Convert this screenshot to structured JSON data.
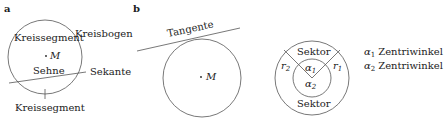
{
  "panels": {
    "a": {
      "label": "a",
      "segment_top": "Kreissegment",
      "arc": "Kreisbogen",
      "center": "M",
      "chord": "Sehne",
      "secant": "Sekante",
      "segment_bottom": "Kreissegment"
    },
    "b": {
      "label": "b",
      "tangent": "Tangente",
      "center": "M"
    },
    "c": {
      "sector_top": "Sektor",
      "sector_bottom": "Sektor",
      "r1": "r",
      "r1_sub": "1",
      "r2": "r",
      "r2_sub": "2",
      "alpha1": "α",
      "alpha1_sub": "1",
      "alpha2": "α",
      "alpha2_sub": "2"
    },
    "legend": [
      {
        "symbol": "α",
        "sub": "1",
        "text": "Zentriwinkel"
      },
      {
        "symbol": "α",
        "sub": "2",
        "text": "Zentriwinkel"
      }
    ]
  },
  "colors": {
    "stroke": "#555555",
    "text": "#222222"
  }
}
